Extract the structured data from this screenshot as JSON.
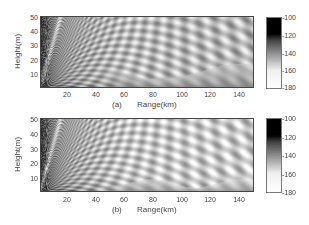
{
  "chart_data": [
    {
      "type": "heatmap",
      "panel_label": "(a)",
      "title": "",
      "xlabel": "Range(km)",
      "ylabel": "Height(m)",
      "xlim": [
        0,
        150
      ],
      "ylim": [
        0,
        52
      ],
      "x_ticks": [
        20,
        40,
        60,
        80,
        100,
        120,
        140
      ],
      "y_ticks": [
        10,
        20,
        30,
        40,
        50
      ],
      "colorbar": {
        "ticks": [
          -100,
          -120,
          -140,
          -160,
          -180
        ],
        "range": [
          -180,
          -100
        ],
        "colormap": "gray (black = -100, white = -180)"
      },
      "description": "Propagation loss field; dark near source (range 0) with interference lobes fanning out, bright lobed region mid-range, grey band at low heights beyond ~60 km"
    },
    {
      "type": "heatmap",
      "panel_label": "(b)",
      "title": "",
      "xlabel": "Range(km)",
      "ylabel": "Height(m)",
      "xlim": [
        0,
        150
      ],
      "ylim": [
        0,
        52
      ],
      "x_ticks": [
        20,
        40,
        60,
        80,
        100,
        120,
        140
      ],
      "y_ticks": [
        10,
        20,
        30,
        40,
        50
      ],
      "colorbar": {
        "ticks": [
          -100,
          -120,
          -140,
          -160,
          -180
        ],
        "range": [
          -180,
          -100
        ],
        "colormap": "gray (black = -100, white = -180)"
      },
      "description": "Propagation loss field similar to (a) but with brighter far-range region and thinner grey band near the ground"
    }
  ],
  "panels": [
    {
      "id": "a",
      "label": "(a)",
      "xlabel": "Range(km)",
      "ylabel": "Height(m)",
      "x_ticks": [
        "20",
        "40",
        "60",
        "80",
        "100",
        "120",
        "140"
      ],
      "y_ticks": [
        "50",
        "40",
        "30",
        "20",
        "10"
      ],
      "cbar_ticks": [
        "-100",
        "-120",
        "-140",
        "-160",
        "-180"
      ]
    },
    {
      "id": "b",
      "label": "(b)",
      "xlabel": "Range(km)",
      "ylabel": "Height(m)",
      "x_ticks": [
        "20",
        "40",
        "60",
        "80",
        "100",
        "120",
        "140"
      ],
      "y_ticks": [
        "50",
        "40",
        "30",
        "20",
        "10"
      ],
      "cbar_ticks": [
        "-100",
        "-120",
        "-140",
        "-160",
        "-180"
      ]
    }
  ]
}
